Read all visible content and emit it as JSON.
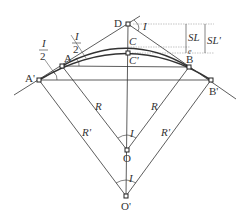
{
  "diagram": {
    "points": {
      "D": {
        "label": "D",
        "x": 128,
        "y": 24
      },
      "A": {
        "label": "A",
        "x": 62,
        "y": 66
      },
      "A_prime": {
        "label": "A'",
        "x": 39,
        "y": 80
      },
      "B": {
        "label": "B",
        "x": 189,
        "y": 67
      },
      "B_prime": {
        "label": "B'",
        "x": 211,
        "y": 80
      },
      "C": {
        "label": "C",
        "x": 128,
        "y": 47
      },
      "C_prime": {
        "label": "C'",
        "x": 128,
        "y": 53
      },
      "O": {
        "label": "O",
        "x": 127,
        "y": 150
      },
      "O_prime": {
        "label": "O'",
        "x": 126,
        "y": 196
      }
    },
    "labels": {
      "half_angle_top_num": "I",
      "half_angle_top_den": "2",
      "half_angle_left_num": "I",
      "half_angle_left_den": "2",
      "angle_D": "I",
      "angle_O": "I",
      "angle_O_prime": "I",
      "radius_left": "R",
      "radius_right": "R",
      "radius_prime_left": "R'",
      "radius_prime_right": "R'",
      "SL": "SL",
      "SL_prime": "SL'",
      "e": "e"
    }
  }
}
